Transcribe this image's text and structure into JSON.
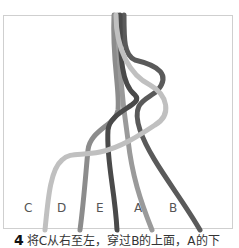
{
  "diagram": {
    "type": "braiding-step-illustration",
    "strands": [
      {
        "label": "C",
        "color": "#b8b8b8"
      },
      {
        "label": "D",
        "color": "#8c8c8c"
      },
      {
        "label": "E",
        "color": "#4a4a4a"
      },
      {
        "label": "A",
        "color": "#9a9a9a"
      },
      {
        "label": "B",
        "color": "#5a5a5a"
      }
    ],
    "labels": [
      "C",
      "D",
      "E",
      "A",
      "B"
    ]
  },
  "caption": {
    "step_number": "4",
    "text": "将C从右至左，穿过B的上面，A的下"
  }
}
